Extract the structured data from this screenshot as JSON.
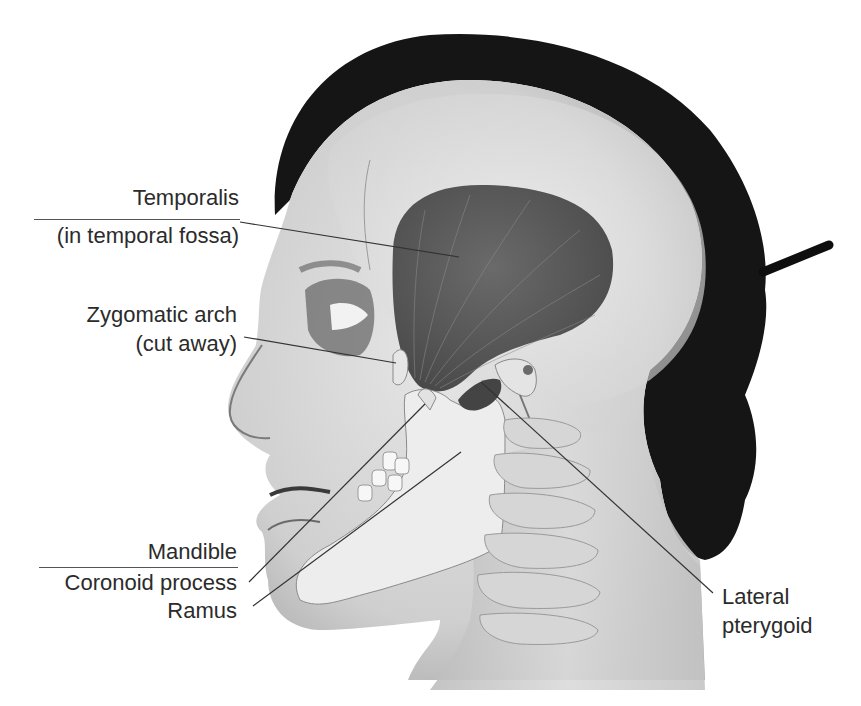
{
  "figure": {
    "labels": {
      "temporalis": {
        "line1": "Temporalis",
        "line2": "(in temporal fossa)"
      },
      "zygomatic": {
        "line1": "Zygomatic arch",
        "line2": "(cut away)"
      },
      "mandible": {
        "heading": "Mandible",
        "item1": "Coronoid process",
        "item2": "Ramus"
      },
      "lateral_pterygoid": {
        "line1": "Lateral",
        "line2": "pterygoid"
      }
    },
    "leader_lines": [
      {
        "label": "Temporalis",
        "from": [
          240,
          222
        ],
        "to": [
          459,
          257
        ]
      },
      {
        "label": "Zygomatic arch",
        "from": [
          244,
          337
        ],
        "to": [
          396,
          363
        ]
      },
      {
        "label": "Coronoid process",
        "from": [
          249,
          582
        ],
        "to": [
          425,
          404
        ]
      },
      {
        "label": "Ramus",
        "from": [
          253,
          606
        ],
        "to": [
          461,
          452
        ]
      },
      {
        "label": "Lateral pterygoid",
        "from": [
          481,
          382
        ],
        "to": [
          713,
          593
        ]
      }
    ],
    "colors": {
      "text": "#2b2b2b",
      "leader": "#333333",
      "hair": "#141414",
      "muscle": "#5a5a5a",
      "skin": "#d8d8d8",
      "bone": "#ececec"
    }
  }
}
